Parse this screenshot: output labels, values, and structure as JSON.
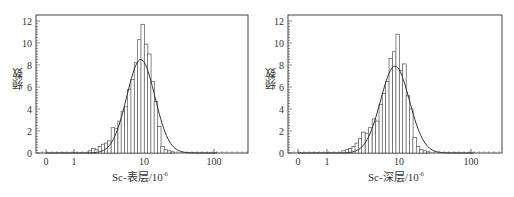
{
  "chart_data": [
    {
      "type": "bar",
      "subtype": "histogram-with-normal-fit",
      "title": "",
      "xlabel": "Sc-表层/10⁻⁶",
      "ylabel": "频数",
      "x_scale": "log",
      "xticks": [
        "0",
        "1",
        "10",
        "100"
      ],
      "yticks": [
        0,
        2,
        4,
        6,
        8,
        10,
        12
      ],
      "ylim": [
        0,
        12.5
      ],
      "grid": false,
      "legend": null,
      "bin_centers": [
        1.7,
        1.9,
        2.1,
        2.35,
        2.6,
        2.9,
        3.2,
        3.6,
        4.0,
        4.5,
        5.0,
        5.6,
        6.2,
        6.9,
        7.7,
        8.6,
        9.6,
        10.7,
        11.9,
        13.3,
        14.8,
        16.5,
        18.4,
        20.5,
        22.9,
        25.5
      ],
      "values": [
        0.2,
        0.4,
        0.3,
        0.6,
        0.8,
        0.9,
        1.1,
        2.3,
        2.2,
        2.9,
        3.8,
        4.2,
        5.8,
        6.7,
        8.2,
        10.3,
        11.7,
        9.9,
        9.0,
        6.5,
        4.7,
        2.4,
        0.6,
        0.3,
        0.2,
        0.1
      ],
      "fit_curve": {
        "type": "normal",
        "peak_x": 9.0,
        "peak_y": 8.5
      }
    },
    {
      "type": "bar",
      "subtype": "histogram-with-normal-fit",
      "title": "",
      "xlabel": "Sc-深层/10⁻⁶",
      "ylabel": "频数",
      "x_scale": "log",
      "xticks": [
        "0",
        "1",
        "10",
        "100"
      ],
      "yticks": [
        0,
        2,
        4,
        6,
        8,
        10,
        12
      ],
      "ylim": [
        0,
        12.5
      ],
      "grid": false,
      "legend": null,
      "bin_centers": [
        1.7,
        1.9,
        2.1,
        2.35,
        2.6,
        2.9,
        3.2,
        3.6,
        4.0,
        4.5,
        5.0,
        5.6,
        6.2,
        6.9,
        7.7,
        8.6,
        9.6,
        10.7,
        11.9,
        13.3,
        14.8,
        16.5,
        18.4,
        20.5,
        22.9,
        25.5
      ],
      "values": [
        0.2,
        0.3,
        0.4,
        0.6,
        0.9,
        1.3,
        1.9,
        1.8,
        2.3,
        3.1,
        2.9,
        4.4,
        5.4,
        6.5,
        8.6,
        9.2,
        10.8,
        7.5,
        8.1,
        5.2,
        4.0,
        1.4,
        0.6,
        0.3,
        0.2,
        0.1
      ],
      "fit_curve": {
        "type": "normal",
        "peak_x": 8.8,
        "peak_y": 7.9
      }
    }
  ],
  "charts": [
    {
      "xlabel_main": "Sc-表层/10",
      "xlabel_exp": "-6",
      "ylabel": "频数"
    },
    {
      "xlabel_main": "Sc-深层/10",
      "xlabel_exp": "-6",
      "ylabel": "频数"
    }
  ],
  "colors": {
    "axis": "#444444",
    "bar_edge": "#555555",
    "bar_fill": "#ffffff",
    "curve": "#333333"
  }
}
